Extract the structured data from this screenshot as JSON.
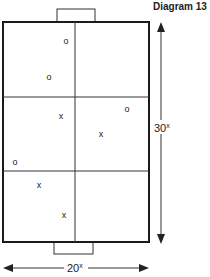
{
  "title": "Diagram 13",
  "dimensions": {
    "length_label": "30",
    "length_unit": "x",
    "width_label": "20",
    "width_unit": "x"
  },
  "players": [
    {
      "mark": "O",
      "x": 66,
      "y": 40
    },
    {
      "mark": "O",
      "x": 49,
      "y": 76
    },
    {
      "mark": "X",
      "x": 61,
      "y": 115
    },
    {
      "mark": "O",
      "x": 127,
      "y": 108
    },
    {
      "mark": "X",
      "x": 101,
      "y": 133
    },
    {
      "mark": "O",
      "x": 15,
      "y": 161
    },
    {
      "mark": "X",
      "x": 39,
      "y": 184
    },
    {
      "mark": "X",
      "x": 64,
      "y": 214
    }
  ],
  "colors": {
    "line": "#1a1a1a",
    "background": "#ffffff"
  }
}
